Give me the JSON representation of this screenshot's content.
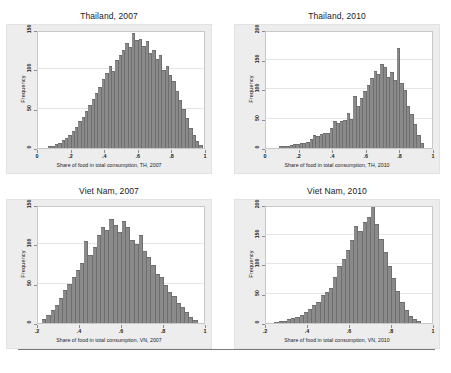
{
  "figure": {
    "background_color": "#ffffff",
    "panel_background_color": "#ededed",
    "plot_background_color": "#ffffff",
    "bar_color": "#8a8a8a",
    "gridline_color": "#e6e6e6",
    "axis_color": "#8c8c8c",
    "bottom_rule": true
  },
  "chart_data": [
    {
      "type": "bar",
      "id": "thailand-2007",
      "title": "Thailand, 2007",
      "xlabel": "Share of food in total consumption, TH, 2007",
      "ylabel": "Frequency",
      "xlim": [
        0,
        1
      ],
      "ylim": [
        0,
        150
      ],
      "xticks": [
        "0",
        ".2",
        ".4",
        ".6",
        ".8",
        "1"
      ],
      "xtick_values": [
        0,
        0.2,
        0.4,
        0.6,
        0.8,
        1
      ],
      "yticks": [
        "0",
        "50",
        "100",
        "150"
      ],
      "ytick_values": [
        0,
        50,
        100,
        150
      ],
      "grid": true,
      "legend": "none",
      "bin_width": 0.02,
      "bin_starts": [
        0.06,
        0.08,
        0.1,
        0.12,
        0.14,
        0.16,
        0.18,
        0.2,
        0.22,
        0.24,
        0.26,
        0.28,
        0.3,
        0.32,
        0.34,
        0.36,
        0.38,
        0.4,
        0.42,
        0.44,
        0.46,
        0.48,
        0.5,
        0.52,
        0.54,
        0.56,
        0.58,
        0.6,
        0.62,
        0.64,
        0.66,
        0.68,
        0.7,
        0.72,
        0.74,
        0.76,
        0.78,
        0.8,
        0.82,
        0.84,
        0.86,
        0.88,
        0.9,
        0.92,
        0.94,
        0.96
      ],
      "values": [
        2,
        3,
        5,
        7,
        10,
        13,
        17,
        22,
        27,
        34,
        40,
        47,
        55,
        62,
        70,
        78,
        88,
        95,
        104,
        98,
        112,
        118,
        125,
        133,
        128,
        146,
        137,
        139,
        130,
        136,
        121,
        124,
        113,
        118,
        99,
        104,
        93,
        85,
        72,
        61,
        50,
        38,
        26,
        16,
        9,
        4
      ]
    },
    {
      "type": "bar",
      "id": "thailand-2010",
      "title": "Thailand, 2010",
      "xlabel": "Share of food in total consumption, TH, 2010",
      "ylabel": "Frequency",
      "xlim": [
        0,
        1
      ],
      "ylim": [
        0,
        200
      ],
      "xticks": [
        "0",
        ".2",
        ".4",
        ".6",
        ".8",
        "1"
      ],
      "xtick_values": [
        0,
        0.2,
        0.4,
        0.6,
        0.8,
        1
      ],
      "yticks": [
        "0",
        "50",
        "100",
        "150",
        "200"
      ],
      "ytick_values": [
        0,
        50,
        100,
        150,
        200
      ],
      "grid": true,
      "legend": "none",
      "bin_width": 0.02,
      "bin_starts": [
        0.08,
        0.1,
        0.12,
        0.14,
        0.16,
        0.18,
        0.2,
        0.22,
        0.24,
        0.26,
        0.28,
        0.3,
        0.32,
        0.34,
        0.36,
        0.38,
        0.4,
        0.42,
        0.44,
        0.46,
        0.48,
        0.5,
        0.52,
        0.54,
        0.56,
        0.58,
        0.6,
        0.62,
        0.64,
        0.66,
        0.68,
        0.7,
        0.72,
        0.74,
        0.76,
        0.78,
        0.8,
        0.82,
        0.84,
        0.86,
        0.88,
        0.9,
        0.92
      ],
      "values": [
        3,
        4,
        4,
        5,
        6,
        6,
        8,
        9,
        11,
        16,
        22,
        20,
        24,
        26,
        25,
        34,
        46,
        43,
        45,
        47,
        60,
        49,
        88,
        72,
        84,
        96,
        106,
        118,
        130,
        126,
        142,
        138,
        120,
        128,
        116,
        170,
        110,
        98,
        72,
        58,
        40,
        22,
        8
      ]
    },
    {
      "type": "bar",
      "id": "vietnam-2007",
      "title": "Viet Nam, 2007",
      "xlabel": "Share of food in total consumption, VN, 2007",
      "ylabel": "Frequency",
      "xlim": [
        0.2,
        1
      ],
      "ylim": [
        0,
        150
      ],
      "xticks": [
        ".2",
        ".4",
        ".6",
        ".8",
        "1"
      ],
      "xtick_values": [
        0.2,
        0.4,
        0.6,
        0.8,
        1
      ],
      "yticks": [
        "0",
        "50",
        "100",
        "150"
      ],
      "ytick_values": [
        0,
        50,
        100,
        150
      ],
      "grid": true,
      "legend": "none",
      "bin_width": 0.02,
      "bin_starts": [
        0.22,
        0.24,
        0.26,
        0.28,
        0.3,
        0.32,
        0.34,
        0.36,
        0.38,
        0.4,
        0.42,
        0.44,
        0.46,
        0.48,
        0.5,
        0.52,
        0.54,
        0.56,
        0.58,
        0.6,
        0.62,
        0.64,
        0.66,
        0.68,
        0.7,
        0.72,
        0.74,
        0.76,
        0.78,
        0.8,
        0.82,
        0.84,
        0.86,
        0.88,
        0.9,
        0.92,
        0.94
      ],
      "values": [
        5,
        10,
        16,
        23,
        32,
        42,
        50,
        58,
        68,
        76,
        104,
        86,
        96,
        112,
        122,
        118,
        132,
        124,
        116,
        130,
        122,
        106,
        100,
        112,
        92,
        84,
        74,
        62,
        58,
        48,
        40,
        34,
        26,
        20,
        14,
        8,
        4
      ]
    },
    {
      "type": "bar",
      "id": "vietnam-2010",
      "title": "Viet Nam, 2010",
      "xlabel": "Share of food in total consumption, VN, 2010",
      "ylabel": "Frequency",
      "xlim": [
        0.2,
        1
      ],
      "ylim": [
        0,
        200
      ],
      "xticks": [
        ".2",
        ".4",
        ".6",
        ".8",
        "1"
      ],
      "xtick_values": [
        0.2,
        0.4,
        0.6,
        0.8,
        1
      ],
      "yticks": [
        "0",
        "50",
        "100",
        "150",
        "200"
      ],
      "ytick_values": [
        0,
        50,
        100,
        150,
        200
      ],
      "grid": true,
      "legend": "none",
      "bin_width": 0.02,
      "bin_starts": [
        0.24,
        0.26,
        0.28,
        0.3,
        0.32,
        0.34,
        0.36,
        0.38,
        0.4,
        0.42,
        0.44,
        0.46,
        0.48,
        0.5,
        0.52,
        0.54,
        0.56,
        0.58,
        0.6,
        0.62,
        0.64,
        0.66,
        0.68,
        0.7,
        0.72,
        0.74,
        0.76,
        0.78,
        0.8,
        0.82,
        0.84,
        0.86,
        0.88,
        0.9,
        0.92
      ],
      "values": [
        2,
        3,
        4,
        6,
        8,
        10,
        14,
        18,
        24,
        30,
        36,
        48,
        52,
        60,
        78,
        96,
        108,
        124,
        140,
        164,
        156,
        172,
        180,
        200,
        168,
        142,
        120,
        96,
        76,
        54,
        36,
        22,
        12,
        6,
        3
      ]
    }
  ]
}
